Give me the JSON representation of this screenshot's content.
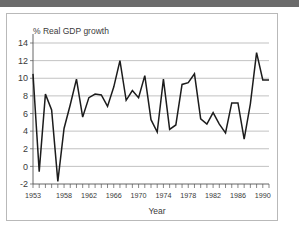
{
  "figure": {
    "top_band_color": "#6b6b6b",
    "frame_border_color": "#b9b9b9",
    "background": "#ffffff"
  },
  "chart_data": {
    "type": "line",
    "title": "% Real GDP growth",
    "xlabel": "Year",
    "ylabel": "",
    "xlim": [
      1953,
      1991
    ],
    "ylim": [
      -2,
      14
    ],
    "yticks": [
      -2,
      0,
      2,
      4,
      6,
      8,
      10,
      12,
      14
    ],
    "xticks": [
      1953,
      1958,
      1962,
      1966,
      1970,
      1974,
      1978,
      1982,
      1986,
      1990
    ],
    "xtick_labels": [
      "1953",
      "1958",
      "1962",
      "1966",
      "1970",
      "1974",
      "1978",
      "1982",
      "1986",
      "1990"
    ],
    "ytick_labels": [
      "-2",
      "0",
      "2",
      "4",
      "6",
      "8",
      "10",
      "12",
      "14"
    ],
    "grid": true,
    "grid_axis": "y",
    "legend": false,
    "line_color": "#1c1c1c",
    "minor_xticks": true,
    "x": [
      1953,
      1954,
      1955,
      1956,
      1957,
      1958,
      1959,
      1960,
      1961,
      1962,
      1963,
      1964,
      1965,
      1966,
      1967,
      1968,
      1969,
      1970,
      1971,
      1972,
      1973,
      1974,
      1975,
      1976,
      1977,
      1978,
      1979,
      1980,
      1981,
      1982,
      1983,
      1984,
      1985,
      1986,
      1987,
      1988,
      1989,
      1990,
      1991
    ],
    "values": [
      10.5,
      -0.6,
      8.2,
      6.4,
      -1.7,
      4.3,
      7.0,
      9.9,
      5.6,
      7.8,
      8.2,
      8.1,
      6.8,
      9.0,
      12.0,
      7.5,
      8.6,
      7.8,
      10.3,
      5.3,
      3.9,
      9.9,
      4.2,
      4.7,
      9.3,
      9.5,
      10.5,
      5.4,
      4.8,
      6.1,
      4.8,
      3.8,
      7.2,
      7.2,
      3.1,
      7.1,
      12.9,
      9.8,
      9.8
    ],
    "series": [
      {
        "name": "Real GDP growth",
        "values": [
          10.5,
          -0.6,
          8.2,
          6.4,
          -1.7,
          4.3,
          7.0,
          9.9,
          5.6,
          7.8,
          8.2,
          8.1,
          6.8,
          9.0,
          12.0,
          7.5,
          8.6,
          7.8,
          10.3,
          5.3,
          3.9,
          9.9,
          4.2,
          4.7,
          9.3,
          9.5,
          10.5,
          5.4,
          4.8,
          6.1,
          4.8,
          3.8,
          7.2,
          7.2,
          3.1,
          7.1,
          12.9,
          9.8,
          9.8
        ]
      }
    ]
  }
}
